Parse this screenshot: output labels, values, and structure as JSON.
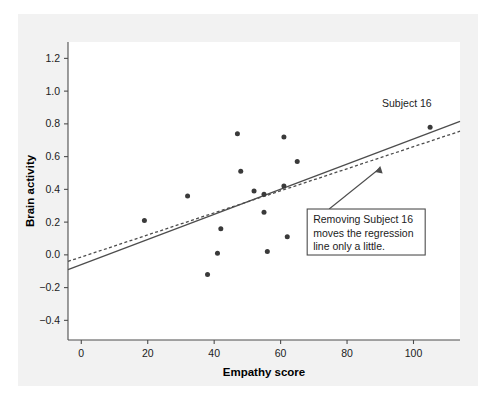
{
  "figure": {
    "background_color": "#f2f2f2",
    "panel_color": "#ffffff",
    "axis_color": "#4d4d4d",
    "point_color": "#3a3a3a",
    "line_color": "#4d4d4d"
  },
  "chart_data": {
    "type": "scatter",
    "title": "",
    "xlabel": "Empathy score",
    "ylabel": "Brain activity",
    "xlim": [
      -4,
      114
    ],
    "ylim": [
      -0.52,
      1.3
    ],
    "xticks": [
      0,
      20,
      40,
      60,
      80,
      100
    ],
    "xtick_labels": [
      "0",
      "20",
      "40",
      "60",
      "80",
      "100"
    ],
    "yticks": [
      -0.4,
      -0.2,
      0.0,
      0.2,
      0.4,
      0.6,
      0.8,
      1.0,
      1.2
    ],
    "ytick_labels": [
      "-0.4",
      "-0.2",
      "0.0",
      "0.2",
      "0.4",
      "0.6",
      "0.8",
      "1.0",
      "1.2"
    ],
    "grid": false,
    "legend": null,
    "points": [
      {
        "x": 19,
        "y": 0.21
      },
      {
        "x": 32,
        "y": 0.36
      },
      {
        "x": 38,
        "y": -0.12
      },
      {
        "x": 41,
        "y": 0.01
      },
      {
        "x": 42,
        "y": 0.16
      },
      {
        "x": 47,
        "y": 0.74
      },
      {
        "x": 48,
        "y": 0.51
      },
      {
        "x": 52,
        "y": 0.39
      },
      {
        "x": 55,
        "y": 0.37
      },
      {
        "x": 55,
        "y": 0.26
      },
      {
        "x": 56,
        "y": 0.02
      },
      {
        "x": 61,
        "y": 0.72
      },
      {
        "x": 61,
        "y": 0.42
      },
      {
        "x": 62,
        "y": 0.11
      },
      {
        "x": 65,
        "y": 0.57
      },
      {
        "x": 105,
        "y": 0.78
      }
    ],
    "series": [
      {
        "name": "regression-all-subjects",
        "style": "solid",
        "x": [
          -4,
          114
        ],
        "y": [
          -0.09,
          0.815
        ]
      },
      {
        "name": "regression-without-subject-16",
        "style": "dashed",
        "x": [
          -4,
          114
        ],
        "y": [
          -0.04,
          0.755
        ]
      }
    ],
    "annotations": [
      {
        "name": "subject-16-label",
        "text": "Subject 16",
        "x": 98,
        "y": 0.9
      },
      {
        "name": "regression-callout",
        "lines": [
          "Removing Subject 16",
          "moves the regression",
          "line only a little."
        ],
        "box_x": 68,
        "box_y": 0.28,
        "arrow_to_x": 90,
        "arrow_to_y": 0.555
      }
    ]
  }
}
